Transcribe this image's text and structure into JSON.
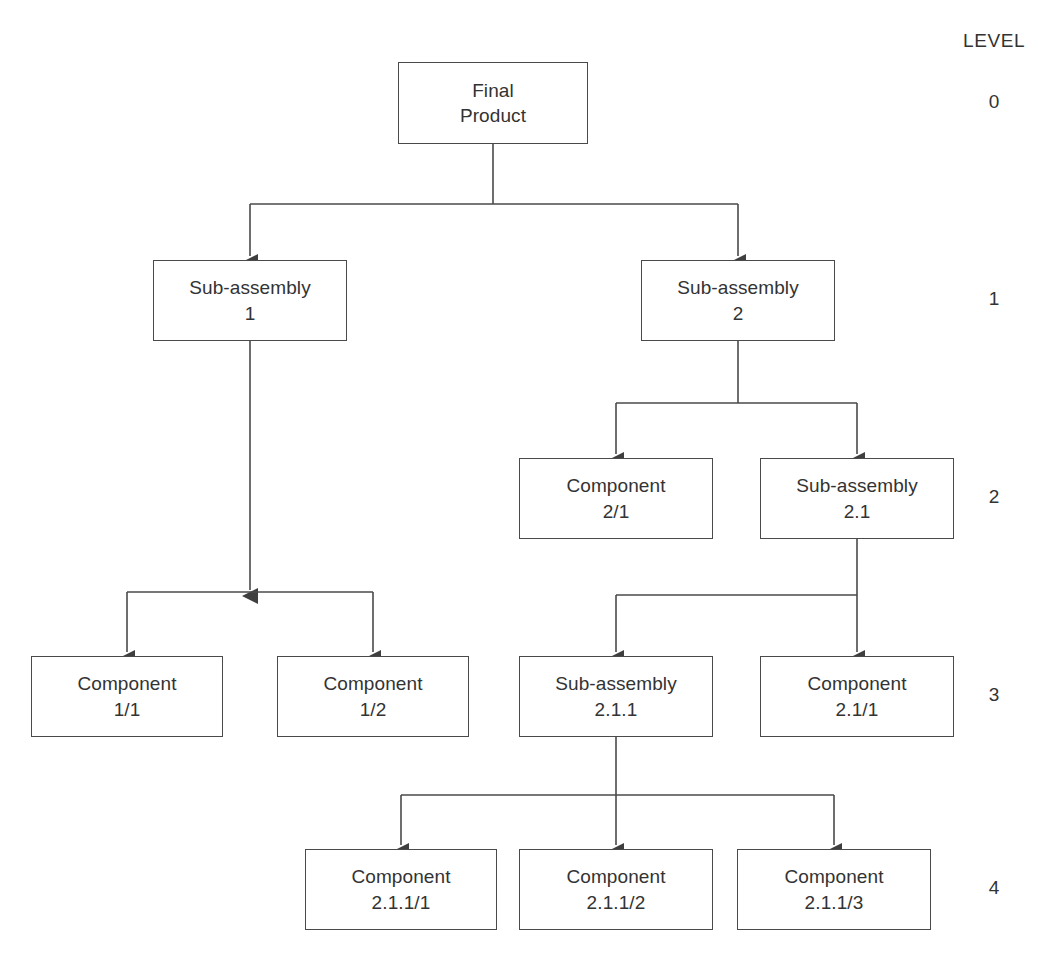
{
  "diagram": {
    "title_column_label": "LEVEL",
    "line_color": "#4a4a4a",
    "text_color": "#333333",
    "background": "#ffffff",
    "levels": [
      {
        "number": "0",
        "y": 103
      },
      {
        "number": "1",
        "y": 300
      },
      {
        "number": "2",
        "y": 498
      },
      {
        "number": "3",
        "y": 696
      },
      {
        "number": "4",
        "y": 889
      }
    ],
    "nodes": [
      {
        "id": "final-product",
        "line1": "Final",
        "line2": "Product",
        "level": 0,
        "x": 398,
        "y": 62,
        "w": 190,
        "h": 82
      },
      {
        "id": "sub-assembly-1",
        "line1": "Sub-assembly",
        "line2": "1",
        "level": 1,
        "x": 153,
        "y": 260,
        "w": 194,
        "h": 81
      },
      {
        "id": "sub-assembly-2",
        "line1": "Sub-assembly",
        "line2": "2",
        "level": 1,
        "x": 641,
        "y": 260,
        "w": 194,
        "h": 81
      },
      {
        "id": "component-2-1",
        "line1": "Component",
        "line2": "2/1",
        "level": 2,
        "x": 519,
        "y": 458,
        "w": 194,
        "h": 81
      },
      {
        "id": "sub-assembly-2-1",
        "line1": "Sub-assembly",
        "line2": "2.1",
        "level": 2,
        "x": 760,
        "y": 458,
        "w": 194,
        "h": 81
      },
      {
        "id": "component-1-1",
        "line1": "Component",
        "line2": "1/1",
        "level": 3,
        "x": 31,
        "y": 656,
        "w": 192,
        "h": 81
      },
      {
        "id": "component-1-2",
        "line1": "Component",
        "line2": "1/2",
        "level": 3,
        "x": 277,
        "y": 656,
        "w": 192,
        "h": 81
      },
      {
        "id": "sub-assembly-2-1-1",
        "line1": "Sub-assembly",
        "line2": "2.1.1",
        "level": 3,
        "x": 519,
        "y": 656,
        "w": 194,
        "h": 81
      },
      {
        "id": "component-2-1-slash-1",
        "line1": "Component",
        "line2": "2.1/1",
        "level": 3,
        "x": 760,
        "y": 656,
        "w": 194,
        "h": 81
      },
      {
        "id": "component-2-1-1-slash-1",
        "line1": "Component",
        "line2": "2.1.1/1",
        "level": 4,
        "x": 305,
        "y": 849,
        "w": 192,
        "h": 81
      },
      {
        "id": "component-2-1-1-slash-2",
        "line1": "Component",
        "line2": "2.1.1/2",
        "level": 4,
        "x": 519,
        "y": 849,
        "w": 194,
        "h": 81
      },
      {
        "id": "component-2-1-1-slash-3",
        "line1": "Component",
        "line2": "2.1.1/3",
        "level": 4,
        "x": 737,
        "y": 849,
        "w": 194,
        "h": 81
      }
    ],
    "edges": [
      {
        "id": "edge-final-to-sub1",
        "from": "final-product",
        "to": "sub-assembly-1"
      },
      {
        "id": "edge-final-to-sub2",
        "from": "final-product",
        "to": "sub-assembly-2"
      },
      {
        "id": "edge-sub1-to-comp11",
        "from": "sub-assembly-1",
        "to": "component-1-1"
      },
      {
        "id": "edge-sub1-to-comp12",
        "from": "sub-assembly-1",
        "to": "component-1-2"
      },
      {
        "id": "edge-sub2-to-comp21",
        "from": "sub-assembly-2",
        "to": "component-2-1"
      },
      {
        "id": "edge-sub2-to-sub21",
        "from": "sub-assembly-2",
        "to": "sub-assembly-2-1"
      },
      {
        "id": "edge-sub21-to-sub211",
        "from": "sub-assembly-2-1",
        "to": "sub-assembly-2-1-1"
      },
      {
        "id": "edge-sub21-to-comp211",
        "from": "sub-assembly-2-1",
        "to": "component-2-1-slash-1"
      },
      {
        "id": "edge-sub211-to-c1",
        "from": "sub-assembly-2-1-1",
        "to": "component-2-1-1-slash-1"
      },
      {
        "id": "edge-sub211-to-c2",
        "from": "sub-assembly-2-1-1",
        "to": "component-2-1-1-slash-2"
      },
      {
        "id": "edge-sub211-to-c3",
        "from": "sub-assembly-2-1-1",
        "to": "component-2-1-1-slash-3"
      }
    ]
  }
}
